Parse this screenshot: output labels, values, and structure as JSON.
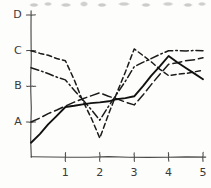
{
  "chart_data": {
    "type": "line",
    "title": "",
    "xlabel": "",
    "ylabel": "",
    "grid": false,
    "legend": "none",
    "style": "hand-drawn sketch",
    "x": [
      0,
      1,
      2,
      3,
      4,
      5
    ],
    "xtick_labels": [
      "1",
      "2",
      "3",
      "4",
      "5"
    ],
    "xtick_values": [
      1,
      2,
      3,
      4,
      5
    ],
    "ytick_labels": [
      "A",
      "B",
      "C",
      "D"
    ],
    "ytick_values": [
      1,
      2,
      3,
      4
    ],
    "ylim": [
      0,
      4.35
    ],
    "xlim": [
      0,
      5.2
    ],
    "series": [
      {
        "name": "series-1",
        "line_style": "dashed",
        "color": "#1b1b1b",
        "values": [
          3.0,
          2.72,
          0.55,
          3.05,
          2.3,
          2.45
        ]
      },
      {
        "name": "series-2",
        "line_style": "dash-dot",
        "color": "#1b1b1b",
        "values": [
          2.52,
          2.18,
          1.05,
          2.55,
          3.0,
          3.0
        ]
      },
      {
        "name": "series-3",
        "line_style": "long-dash",
        "color": "#1b1b1b",
        "values": [
          1.0,
          1.45,
          1.82,
          1.48,
          2.62,
          2.8
        ]
      },
      {
        "name": "series-4",
        "line_style": "solid",
        "color": "#111111",
        "values": [
          0.42,
          1.42,
          1.55,
          1.72,
          2.85,
          2.2
        ]
      }
    ]
  },
  "axes": {
    "y_labels": [
      {
        "text": "D",
        "value": 4
      },
      {
        "text": "C",
        "value": 3
      },
      {
        "text": "B",
        "value": 2
      },
      {
        "text": "A",
        "value": 1
      }
    ],
    "x_labels": [
      {
        "text": "1",
        "value": 1
      },
      {
        "text": "2",
        "value": 2
      },
      {
        "text": "3",
        "value": 3
      },
      {
        "text": "4",
        "value": 4
      },
      {
        "text": "5",
        "value": 5
      }
    ]
  }
}
